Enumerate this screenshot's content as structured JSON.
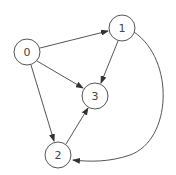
{
  "diagram": {
    "type": "directed-graph",
    "nodes": [
      {
        "id": "0",
        "label": "0",
        "x": 27,
        "y": 52
      },
      {
        "id": "1",
        "label": "1",
        "x": 122,
        "y": 28
      },
      {
        "id": "2",
        "label": "2",
        "x": 58,
        "y": 155
      },
      {
        "id": "3",
        "label": "3",
        "x": 95,
        "y": 96
      }
    ],
    "edges": [
      {
        "from": "0",
        "to": "1"
      },
      {
        "from": "0",
        "to": "3"
      },
      {
        "from": "0",
        "to": "2"
      },
      {
        "from": "1",
        "to": "3"
      },
      {
        "from": "2",
        "to": "3"
      },
      {
        "from": "1",
        "to": "2",
        "curved": true
      }
    ],
    "colors": {
      "stroke": "#555555",
      "text": "#444444",
      "background": "#ffffff"
    }
  }
}
